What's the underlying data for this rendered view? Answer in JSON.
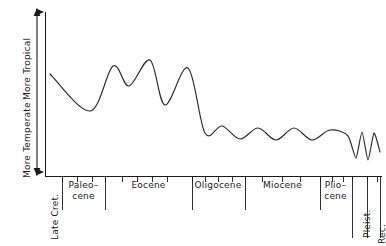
{
  "chart_data": {
    "type": "line",
    "title": "",
    "subtitle": "",
    "xlabel": "",
    "ylabel": "",
    "axis": {
      "y_arrow": "double-headed vertical arrow",
      "y_top_label": "More Tropical",
      "y_bottom_label": "More Temperate",
      "grid": false,
      "legend": null,
      "x_direction": "older (left) to younger (right)",
      "ylim_labels": [
        "More Temperate",
        "More Tropical"
      ]
    },
    "categories": [
      "Late Cret.",
      "Paleo-cene",
      "Eocene",
      "Oligocene",
      "Miocene",
      "Plio-cene",
      "Pleist.",
      "Rec."
    ],
    "series": [
      {
        "name": "Relative climate (tropical vs temperate)",
        "description": "Smooth hand-drawn paleoclimate curve: warm Late Cretaceous, Paleocene cooling dip, three Eocene warm peaks, abrupt Oligocene cooling, damped Miocene-Pliocene oscillations, rapid Pleistocene glacial zigzags",
        "points": [
          {
            "x": 50,
            "y": 74
          },
          {
            "x": 90,
            "y": 111
          },
          {
            "x": 113,
            "y": 66
          },
          {
            "x": 129,
            "y": 86
          },
          {
            "x": 150,
            "y": 60
          },
          {
            "x": 165,
            "y": 105
          },
          {
            "x": 188,
            "y": 68
          },
          {
            "x": 205,
            "y": 133
          },
          {
            "x": 222,
            "y": 126
          },
          {
            "x": 240,
            "y": 139
          },
          {
            "x": 258,
            "y": 128
          },
          {
            "x": 276,
            "y": 140
          },
          {
            "x": 294,
            "y": 128
          },
          {
            "x": 312,
            "y": 140
          },
          {
            "x": 330,
            "y": 130
          },
          {
            "x": 348,
            "y": 136
          },
          {
            "x": 356,
            "y": 158
          },
          {
            "x": 362,
            "y": 132
          },
          {
            "x": 368,
            "y": 160
          },
          {
            "x": 374,
            "y": 133
          },
          {
            "x": 380,
            "y": 152
          }
        ]
      }
    ]
  },
  "epochs": [
    {
      "label": "Late Cret.",
      "orientation": "vertical",
      "x_start": 45,
      "x_end": 62,
      "label_x": 51,
      "label_y": 240
    },
    {
      "label_line1": "Paleo–",
      "label_line2": "cene",
      "orientation": "horizontal",
      "x_start": 62,
      "x_end": 105,
      "label_x": 83,
      "label_y": 186
    },
    {
      "label": "Eocene",
      "orientation": "horizontal",
      "x_start": 105,
      "x_end": 192,
      "label_x": 148,
      "label_y": 186
    },
    {
      "label": "Oligocene",
      "orientation": "horizontal",
      "x_start": 192,
      "x_end": 245,
      "label_x": 218,
      "label_y": 186
    },
    {
      "label": "Miocene",
      "orientation": "horizontal",
      "x_start": 245,
      "x_end": 320,
      "label_x": 282,
      "label_y": 186
    },
    {
      "label_line1": "Plio–",
      "label_line2": "cene",
      "orientation": "horizontal",
      "x_start": 320,
      "x_end": 352,
      "label_x": 336,
      "label_y": 186
    },
    {
      "label": "Pleist.",
      "orientation": "vertical",
      "x_start": 352,
      "x_end": 367,
      "label_x": 363,
      "label_y": 240
    },
    {
      "label": "Rec.",
      "orientation": "vertical",
      "x_start": 367,
      "x_end": 380,
      "label_x": 378,
      "label_y": 243
    }
  ],
  "axis_ticks_x": [
    62,
    77,
    92,
    105,
    122,
    137,
    152,
    167,
    192,
    205,
    218,
    232,
    245,
    262,
    282,
    300,
    320,
    332,
    343,
    352,
    367,
    377
  ],
  "colors": {
    "line": "#1a1a1a",
    "axis": "#1a1a1a",
    "background": "#ffffff"
  }
}
